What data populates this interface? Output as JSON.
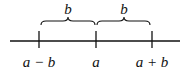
{
  "diagram": {
    "type": "number-line",
    "points": [
      {
        "label": "a − b"
      },
      {
        "label": "a"
      },
      {
        "label": "a + b"
      }
    ],
    "braces": [
      {
        "label": "b",
        "from": "a − b",
        "to": "a"
      },
      {
        "label": "b",
        "from": "a",
        "to": "a + b"
      }
    ]
  }
}
